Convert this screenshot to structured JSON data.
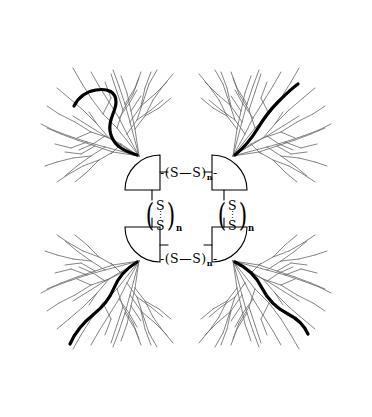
{
  "figure": {
    "name": "cross-linked-dendrimer-disulfide-network",
    "background_color": "#ffffff",
    "branch_color": "#6f6f6f",
    "chain_color": "#000000",
    "core_outline_color": "#000000",
    "label_color": "#000000"
  },
  "linkers": {
    "horizontal": {
      "open": "-(",
      "atom_a": "S",
      "bond": "—",
      "atom_b": "S",
      "close": ")",
      "subscript": "n",
      "tail": "-",
      "full_text": "-(S—S)n-"
    },
    "vertical": {
      "paren_open": "(",
      "atom_top": "S",
      "atom_bottom": "S",
      "paren_close": ")",
      "subscript": "n",
      "full_text": "(S⋮S)n"
    }
  },
  "cores": [
    {
      "id": "top-left",
      "orientation": "arc-up-left"
    },
    {
      "id": "top-right",
      "orientation": "arc-up-right"
    },
    {
      "id": "bottom-left",
      "orientation": "arc-down-left"
    },
    {
      "id": "bottom-right",
      "orientation": "arc-down-right"
    }
  ],
  "dendrons": [
    {
      "id": "top-left",
      "quadrant": "upper-left",
      "has_bold_chain": true
    },
    {
      "id": "top-right",
      "quadrant": "upper-right",
      "has_bold_chain": true
    },
    {
      "id": "bottom-left",
      "quadrant": "lower-left",
      "has_bold_chain": true
    },
    {
      "id": "bottom-right",
      "quadrant": "lower-right",
      "has_bold_chain": true
    }
  ]
}
